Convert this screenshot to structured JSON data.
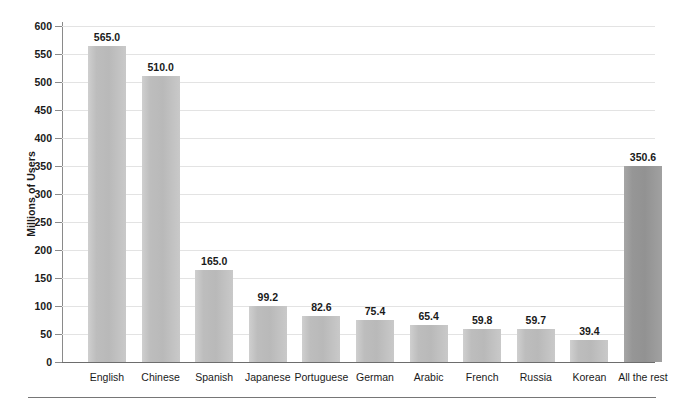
{
  "chart_data": {
    "type": "bar",
    "title": "",
    "subtitle": "",
    "xlabel": "",
    "ylabel": "Millions of Users",
    "ylim": [
      0,
      600
    ],
    "ytick_step": 50,
    "yticks": [
      0,
      50,
      100,
      150,
      200,
      250,
      300,
      350,
      400,
      450,
      500,
      550,
      600
    ],
    "ytick_labels": [
      "0",
      "50",
      "100",
      "150",
      "200",
      "250",
      "300",
      "350",
      "400",
      "450",
      "500",
      "550",
      "600"
    ],
    "grid": true,
    "grid_axis": "y",
    "legend": null,
    "legend_position": "none",
    "categories": [
      "English",
      "Chinese",
      "Spanish",
      "Japanese",
      "Portuguese",
      "German",
      "Arabic",
      "French",
      "Russia",
      "Korean",
      "All the rest"
    ],
    "values": [
      565.0,
      510.0,
      165.0,
      99.2,
      82.6,
      75.4,
      65.4,
      59.8,
      59.7,
      39.4,
      350.6
    ],
    "value_labels": [
      "565.0",
      "510.0",
      "165.0",
      "99.2",
      "82.6",
      "75.4",
      "65.4",
      "59.8",
      "59.7",
      "39.4",
      "350.6"
    ],
    "bar_colors": [
      "#bdbdbd",
      "#bdbdbd",
      "#bdbdbd",
      "#bdbdbd",
      "#bdbdbd",
      "#bdbdbd",
      "#bdbdbd",
      "#bdbdbd",
      "#bdbdbd",
      "#bdbdbd",
      "#969696"
    ],
    "accent_category": "All the rest",
    "accent_color": "#969696",
    "bar_color": "#bdbdbd",
    "gridline_color": "#e3e3e3",
    "axis_color": "#8a8a8a",
    "annotations": []
  }
}
